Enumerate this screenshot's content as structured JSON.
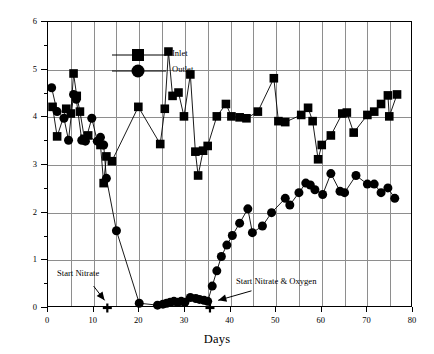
{
  "chart_data": {
    "type": "line",
    "title": "",
    "xlabel": "Days",
    "ylabel": "Concentration (mg/L)",
    "xlim": [
      0,
      80
    ],
    "ylim": [
      0,
      6
    ],
    "xticks": [
      0,
      10,
      20,
      30,
      40,
      50,
      60,
      70,
      80
    ],
    "yticks": [
      0,
      1,
      2,
      3,
      4,
      5,
      6
    ],
    "y_minor_ticks": [
      0.5,
      1.5,
      2.5,
      3.5,
      4.5,
      5.5
    ],
    "grid": "both",
    "grid_x_spacing": 5,
    "grid_y_spacing": 1,
    "legend_position": "top-left",
    "series": [
      {
        "name": "Inlet",
        "marker": "square",
        "color": "#000000",
        "points": [
          [
            1.0,
            4.22
          ],
          [
            2.0,
            3.6
          ],
          [
            4.0,
            4.18
          ],
          [
            5.0,
            4.08
          ],
          [
            5.6,
            4.92
          ],
          [
            6.3,
            4.45
          ],
          [
            7.0,
            4.12
          ],
          [
            8.0,
            3.55
          ],
          [
            8.8,
            3.62
          ],
          [
            11.5,
            3.42
          ],
          [
            12.2,
            2.62
          ],
          [
            12.8,
            3.18
          ],
          [
            14.0,
            3.08
          ],
          [
            19.8,
            4.22
          ],
          [
            24.6,
            3.44
          ],
          [
            25.6,
            4.18
          ],
          [
            26.4,
            5.38
          ],
          [
            27.3,
            4.45
          ],
          [
            28.6,
            4.52
          ],
          [
            29.8,
            4.02
          ],
          [
            31.2,
            4.9
          ],
          [
            32.3,
            3.28
          ],
          [
            32.9,
            2.78
          ],
          [
            34.0,
            3.3
          ],
          [
            35.0,
            3.4
          ],
          [
            37.0,
            4.02
          ],
          [
            39.0,
            4.28
          ],
          [
            40.2,
            4.02
          ],
          [
            42.0,
            4.0
          ],
          [
            43.5,
            3.98
          ],
          [
            46.0,
            4.12
          ],
          [
            49.5,
            4.82
          ],
          [
            50.5,
            3.92
          ],
          [
            52.0,
            3.9
          ],
          [
            55.5,
            4.05
          ],
          [
            57.0,
            4.2
          ],
          [
            58.0,
            3.92
          ],
          [
            59.2,
            3.12
          ],
          [
            60.0,
            3.42
          ],
          [
            62.0,
            3.62
          ],
          [
            64.5,
            4.08
          ],
          [
            65.5,
            4.1
          ],
          [
            67.0,
            3.68
          ],
          [
            70.0,
            4.05
          ],
          [
            71.5,
            4.12
          ],
          [
            73.0,
            4.28
          ],
          [
            74.5,
            4.46
          ],
          [
            74.8,
            4.02
          ],
          [
            76.5,
            4.48
          ]
        ]
      },
      {
        "name": "Outlet",
        "marker": "circle",
        "color": "#000000",
        "points": [
          [
            0.8,
            4.62
          ],
          [
            2.0,
            4.12
          ],
          [
            3.5,
            3.98
          ],
          [
            4.5,
            3.52
          ],
          [
            5.6,
            4.48
          ],
          [
            6.2,
            4.38
          ],
          [
            7.4,
            3.52
          ],
          [
            8.2,
            3.5
          ],
          [
            9.6,
            3.98
          ],
          [
            10.8,
            3.5
          ],
          [
            11.5,
            3.58
          ],
          [
            12.2,
            3.42
          ],
          [
            12.8,
            2.72
          ],
          [
            15.0,
            1.62
          ],
          [
            20.0,
            0.1
          ],
          [
            24.0,
            0.06
          ],
          [
            25.2,
            0.08
          ],
          [
            26.0,
            0.1
          ],
          [
            26.8,
            0.12
          ],
          [
            27.6,
            0.14
          ],
          [
            28.4,
            0.12
          ],
          [
            29.2,
            0.14
          ],
          [
            30.0,
            0.12
          ],
          [
            31.2,
            0.22
          ],
          [
            32.4,
            0.2
          ],
          [
            33.2,
            0.18
          ],
          [
            34.2,
            0.16
          ],
          [
            35.0,
            0.14
          ],
          [
            36.0,
            0.46
          ],
          [
            37.0,
            0.78
          ],
          [
            38.0,
            1.08
          ],
          [
            39.2,
            1.32
          ],
          [
            40.4,
            1.52
          ],
          [
            42.0,
            1.78
          ],
          [
            43.8,
            2.08
          ],
          [
            44.8,
            1.58
          ],
          [
            47.0,
            1.72
          ],
          [
            49.0,
            2.0
          ],
          [
            52.0,
            2.3
          ],
          [
            53.0,
            2.16
          ],
          [
            55.0,
            2.42
          ],
          [
            56.5,
            2.62
          ],
          [
            57.5,
            2.58
          ],
          [
            58.5,
            2.48
          ],
          [
            60.2,
            2.38
          ],
          [
            62.0,
            2.82
          ],
          [
            64.0,
            2.45
          ],
          [
            65.0,
            2.42
          ],
          [
            67.5,
            2.78
          ],
          [
            70.0,
            2.6
          ],
          [
            71.5,
            2.6
          ],
          [
            73.0,
            2.42
          ],
          [
            74.5,
            2.52
          ],
          [
            76.0,
            2.3
          ]
        ]
      }
    ],
    "annotations": [
      {
        "text": "Start Nitrate",
        "marker": "plus",
        "marker_x": 13.0,
        "marker_y": 0.0
      },
      {
        "text": "Start Nitrate & Oxygen",
        "marker": "plus",
        "marker_x": 35.5,
        "marker_y": 0.0
      }
    ]
  },
  "legend": {
    "items": [
      {
        "label": "Inlet"
      },
      {
        "label": "Outlet"
      }
    ]
  },
  "axes": {
    "x_title": "Days",
    "y_title": "Concentration (mg/L)",
    "x_tick_labels": [
      "0",
      "10",
      "20",
      "30",
      "40",
      "50",
      "60",
      "70",
      "80"
    ],
    "y_tick_labels": [
      "0",
      "1",
      "2",
      "3",
      "4",
      "5",
      "6"
    ]
  },
  "annotations": {
    "start_nitrate": "Start Nitrate",
    "start_nitrate_oxygen": "Start Nitrate & Oxygen"
  },
  "colors": {
    "ink": "#000000",
    "grid": "#8e8e8e",
    "background": "#ffffff"
  }
}
